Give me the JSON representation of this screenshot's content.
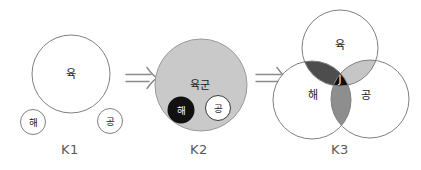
{
  "icons": {
    "transform_arrow_glyph": "⇒"
  },
  "colors": {
    "k2_fill": "#c9c9c9",
    "k2_sea_fill": "#111111",
    "lens_dark": "#4d4d4d",
    "lens_light": "#c6c6c6",
    "lens_mid": "#8e8e8e",
    "joint_fill": "#0f0f0f"
  },
  "k1": {
    "caption": "K1",
    "land": "육",
    "sea": "해",
    "air": "공"
  },
  "k2": {
    "caption": "K2",
    "army": "육군",
    "sea": "해",
    "air": "공"
  },
  "k3": {
    "caption": "K3",
    "land": "육",
    "sea": "해",
    "air": "공",
    "joint": "J"
  }
}
